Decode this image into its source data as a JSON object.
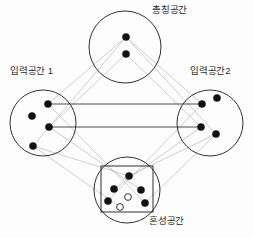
{
  "diagram": {
    "type": "conceptual-blending-network",
    "background_color": "#fdfdfd",
    "stroke_color": "#1a1a1a",
    "projection_line_color": "#b9b9b9",
    "mapping_line_color": "#3a3a3a",
    "element_fill": "#111111",
    "emergent_fill": "#ffffff"
  },
  "labels": {
    "generic": "총칭공간",
    "input1": "입력공간 1",
    "input2": "입력공간2",
    "blend": "혼성공간"
  },
  "spaces": [
    {
      "id": "generic",
      "label": "총칭공간",
      "cx": 125,
      "cy": 47,
      "r": 36,
      "elements": [
        {
          "cx": 126,
          "cy": 37,
          "r": 3.6,
          "kind": "filled"
        },
        {
          "cx": 126,
          "cy": 54,
          "r": 3.6,
          "kind": "filled"
        }
      ]
    },
    {
      "id": "input1",
      "label": "입력공간 1",
      "cx": 43,
      "cy": 123,
      "r": 33,
      "elements": [
        {
          "cx": 48,
          "cy": 104,
          "r": 3.6,
          "kind": "filled"
        },
        {
          "cx": 32,
          "cy": 116,
          "r": 3.6,
          "kind": "filled"
        },
        {
          "cx": 49,
          "cy": 127,
          "r": 3.6,
          "kind": "filled"
        },
        {
          "cx": 33,
          "cy": 146,
          "r": 3.6,
          "kind": "filled"
        }
      ]
    },
    {
      "id": "input2",
      "label": "입력공간2",
      "cx": 210,
      "cy": 123,
      "r": 33,
      "elements": [
        {
          "cx": 202,
          "cy": 104,
          "r": 3.6,
          "kind": "filled"
        },
        {
          "cx": 217,
          "cy": 98,
          "r": 3.6,
          "kind": "filled"
        },
        {
          "cx": 201,
          "cy": 127,
          "r": 3.6,
          "kind": "filled"
        },
        {
          "cx": 216,
          "cy": 134,
          "r": 3.6,
          "kind": "filled"
        }
      ]
    },
    {
      "id": "blend",
      "label": "혼성공간",
      "cx": 127,
      "cy": 190,
      "r": 33,
      "rect": {
        "x": 101,
        "y": 166,
        "width": 52,
        "height": 46
      },
      "elements": [
        {
          "cx": 129,
          "cy": 176,
          "r": 3.6,
          "kind": "filled"
        },
        {
          "cx": 114,
          "cy": 189,
          "r": 3.6,
          "kind": "filled"
        },
        {
          "cx": 141,
          "cy": 190,
          "r": 3.6,
          "kind": "filled"
        },
        {
          "cx": 108,
          "cy": 201,
          "r": 3.6,
          "kind": "filled"
        },
        {
          "cx": 145,
          "cy": 203,
          "r": 3.6,
          "kind": "filled"
        },
        {
          "cx": 128,
          "cy": 197,
          "r": 3.4,
          "kind": "hollow"
        },
        {
          "cx": 120,
          "cy": 207,
          "r": 3.4,
          "kind": "hollow"
        }
      ]
    }
  ],
  "cross_space_mappings": [
    {
      "from": "input1-upper",
      "x1": 48,
      "y1": 104,
      "x2": 202,
      "y2": 104
    },
    {
      "from": "input1-mid",
      "x1": 49,
      "y1": 127,
      "x2": 201,
      "y2": 127
    }
  ],
  "projections": [
    {
      "x1": 126,
      "y1": 37,
      "x2": 48,
      "y2": 104
    },
    {
      "x1": 126,
      "y1": 37,
      "x2": 202,
      "y2": 104
    },
    {
      "x1": 126,
      "y1": 54,
      "x2": 49,
      "y2": 127
    },
    {
      "x1": 126,
      "y1": 54,
      "x2": 201,
      "y2": 127
    },
    {
      "x1": 126,
      "y1": 37,
      "x2": 33,
      "y2": 146
    },
    {
      "x1": 126,
      "y1": 37,
      "x2": 216,
      "y2": 134
    },
    {
      "x1": 48,
      "y1": 104,
      "x2": 145,
      "y2": 203
    },
    {
      "x1": 49,
      "y1": 127,
      "x2": 141,
      "y2": 190
    },
    {
      "x1": 202,
      "y1": 104,
      "x2": 108,
      "y2": 201
    },
    {
      "x1": 201,
      "y1": 127,
      "x2": 114,
      "y2": 189
    },
    {
      "x1": 33,
      "y1": 146,
      "x2": 129,
      "y2": 176
    },
    {
      "x1": 216,
      "y1": 134,
      "x2": 129,
      "y2": 176
    },
    {
      "x1": 33,
      "y1": 146,
      "x2": 120,
      "y2": 207
    },
    {
      "x1": 216,
      "y1": 134,
      "x2": 145,
      "y2": 203
    }
  ]
}
